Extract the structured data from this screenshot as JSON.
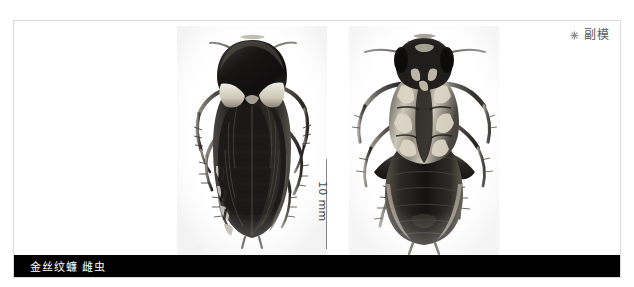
{
  "plate": {
    "background_color": "#ffffff",
    "frame_color": "#d9d9d9"
  },
  "paratype_marker": {
    "icon": "asterisk-icon",
    "label": "副模",
    "color": "#5a5a5a"
  },
  "scale_bar": {
    "label": "10 mm",
    "orientation": "vertical",
    "line_color": "#888888",
    "length_px": 90
  },
  "caption": {
    "text": "金丝纹蠊 雌虫",
    "background_color": "#000000",
    "text_color": "#ffffff"
  },
  "specimens": [
    {
      "name": "dorsal-view",
      "label": "金丝纹蠊 雌虫 背面观",
      "view": "dorsal"
    },
    {
      "name": "ventral-view",
      "label": "金丝纹蠊 雌虫 腹面观",
      "view": "ventral"
    }
  ]
}
